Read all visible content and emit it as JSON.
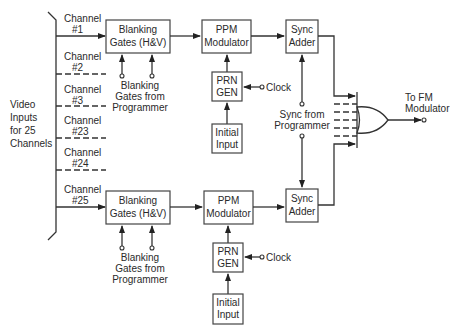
{
  "diagram": {
    "type": "block-diagram",
    "input_label": [
      "Video",
      "Inputs",
      "for 25",
      "Channels"
    ],
    "channels": [
      {
        "label": "Channel",
        "number": "#1",
        "active": true
      },
      {
        "label": "Channel",
        "number": "#2",
        "active": false
      },
      {
        "label": "Channel",
        "number": "#3",
        "active": false
      },
      {
        "label": "Channel",
        "number": "#23",
        "active": false
      },
      {
        "label": "Channel",
        "number": "#24",
        "active": false
      },
      {
        "label": "Channel",
        "number": "#25",
        "active": true
      }
    ],
    "top_chain": {
      "blanking": [
        "Blanking",
        "Gates (H&V)"
      ],
      "blanking_source": [
        "Blanking",
        "Gates from",
        "Programmer"
      ],
      "ppm": [
        "PPM",
        "Modulator"
      ],
      "prn": [
        "PRN",
        "GEN"
      ],
      "clock": "Clock",
      "initial": [
        "Initial",
        "Input"
      ],
      "sync": [
        "Sync",
        "Adder"
      ]
    },
    "bottom_chain": {
      "blanking": [
        "Blanking",
        "Gates (H&V)"
      ],
      "blanking_source": [
        "Blanking",
        "Gates from",
        "Programmer"
      ],
      "ppm": [
        "PPM",
        "Modulator"
      ],
      "prn": [
        "PRN",
        "GEN"
      ],
      "clock": "Clock",
      "initial": [
        "Initial",
        "Input"
      ],
      "sync": [
        "Sync",
        "Adder"
      ]
    },
    "sync_source": [
      "Sync from",
      "Programmer"
    ],
    "output": [
      "To FM",
      "Modulator"
    ]
  }
}
